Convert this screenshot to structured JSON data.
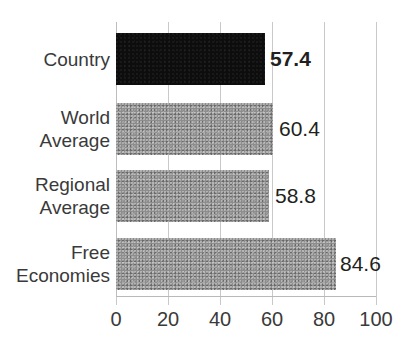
{
  "chart_data": {
    "type": "bar",
    "orientation": "horizontal",
    "title": "",
    "xlabel": "",
    "ylabel": "",
    "categories": [
      "Country",
      "World Average",
      "Regional Average",
      "Free Economies"
    ],
    "category_lines": [
      [
        "Country"
      ],
      [
        "World",
        "Average"
      ],
      [
        "Regional",
        "Average"
      ],
      [
        "Free",
        "Economies"
      ]
    ],
    "values": [
      57.4,
      60.4,
      58.8,
      84.6
    ],
    "value_labels": [
      "57.4",
      "60.4",
      "58.8",
      "84.6"
    ],
    "highlighted_index": 0,
    "bar_colors": [
      "#0d0d0d",
      "#8d8d8d",
      "#8d8d8d",
      "#8d8d8d"
    ],
    "xlim": [
      0,
      100
    ],
    "xticks": [
      0,
      20,
      40,
      60,
      80,
      100
    ],
    "xtick_labels": [
      "0",
      "20",
      "40",
      "60",
      "80",
      "100"
    ],
    "grid": true,
    "legend": false
  },
  "colors": {
    "highlight_bar": "#0d0d0d",
    "standard_bar": "#8d8d8d",
    "gridline": "#c9c9c9",
    "text": "#231f20",
    "background": "#ffffff"
  }
}
